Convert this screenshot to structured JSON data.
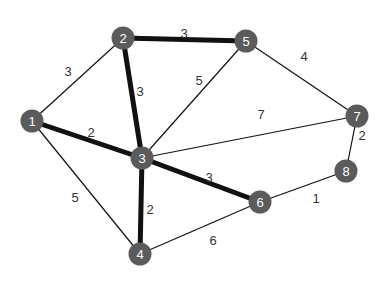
{
  "graph": {
    "node_color": "#5b5b5b",
    "edge_color": "#111111",
    "nodes": [
      {
        "id": "1",
        "x": 32,
        "y": 121
      },
      {
        "id": "2",
        "x": 123,
        "y": 38
      },
      {
        "id": "3",
        "x": 142,
        "y": 158
      },
      {
        "id": "4",
        "x": 140,
        "y": 254
      },
      {
        "id": "5",
        "x": 246,
        "y": 41
      },
      {
        "id": "6",
        "x": 260,
        "y": 202
      },
      {
        "id": "7",
        "x": 357,
        "y": 116
      },
      {
        "id": "8",
        "x": 346,
        "y": 171
      }
    ],
    "edges": [
      {
        "from": "1",
        "to": "2",
        "weight": "3",
        "bold": false,
        "lx": 68,
        "ly": 71
      },
      {
        "from": "1",
        "to": "3",
        "weight": "2",
        "bold": true,
        "lx": 91,
        "ly": 132
      },
      {
        "from": "1",
        "to": "4",
        "weight": "5",
        "bold": false,
        "lx": 75,
        "ly": 197
      },
      {
        "from": "2",
        "to": "3",
        "weight": "3",
        "bold": true,
        "lx": 140,
        "ly": 91
      },
      {
        "from": "2",
        "to": "5",
        "weight": "3",
        "bold": true,
        "lx": 184,
        "ly": 33
      },
      {
        "from": "3",
        "to": "5",
        "weight": "5",
        "bold": false,
        "lx": 199,
        "ly": 80
      },
      {
        "from": "3",
        "to": "7",
        "weight": "7",
        "bold": false,
        "lx": 261,
        "ly": 114
      },
      {
        "from": "3",
        "to": "6",
        "weight": "3",
        "bold": true,
        "lx": 209,
        "ly": 177
      },
      {
        "from": "3",
        "to": "4",
        "weight": "2",
        "bold": true,
        "lx": 150,
        "ly": 209
      },
      {
        "from": "4",
        "to": "6",
        "weight": "6",
        "bold": false,
        "lx": 213,
        "ly": 240
      },
      {
        "from": "5",
        "to": "7",
        "weight": "4",
        "bold": false,
        "lx": 304,
        "ly": 56
      },
      {
        "from": "6",
        "to": "8",
        "weight": "1",
        "bold": false,
        "lx": 316,
        "ly": 198
      },
      {
        "from": "7",
        "to": "8",
        "weight": "2",
        "bold": false,
        "lx": 362,
        "ly": 135
      }
    ]
  }
}
